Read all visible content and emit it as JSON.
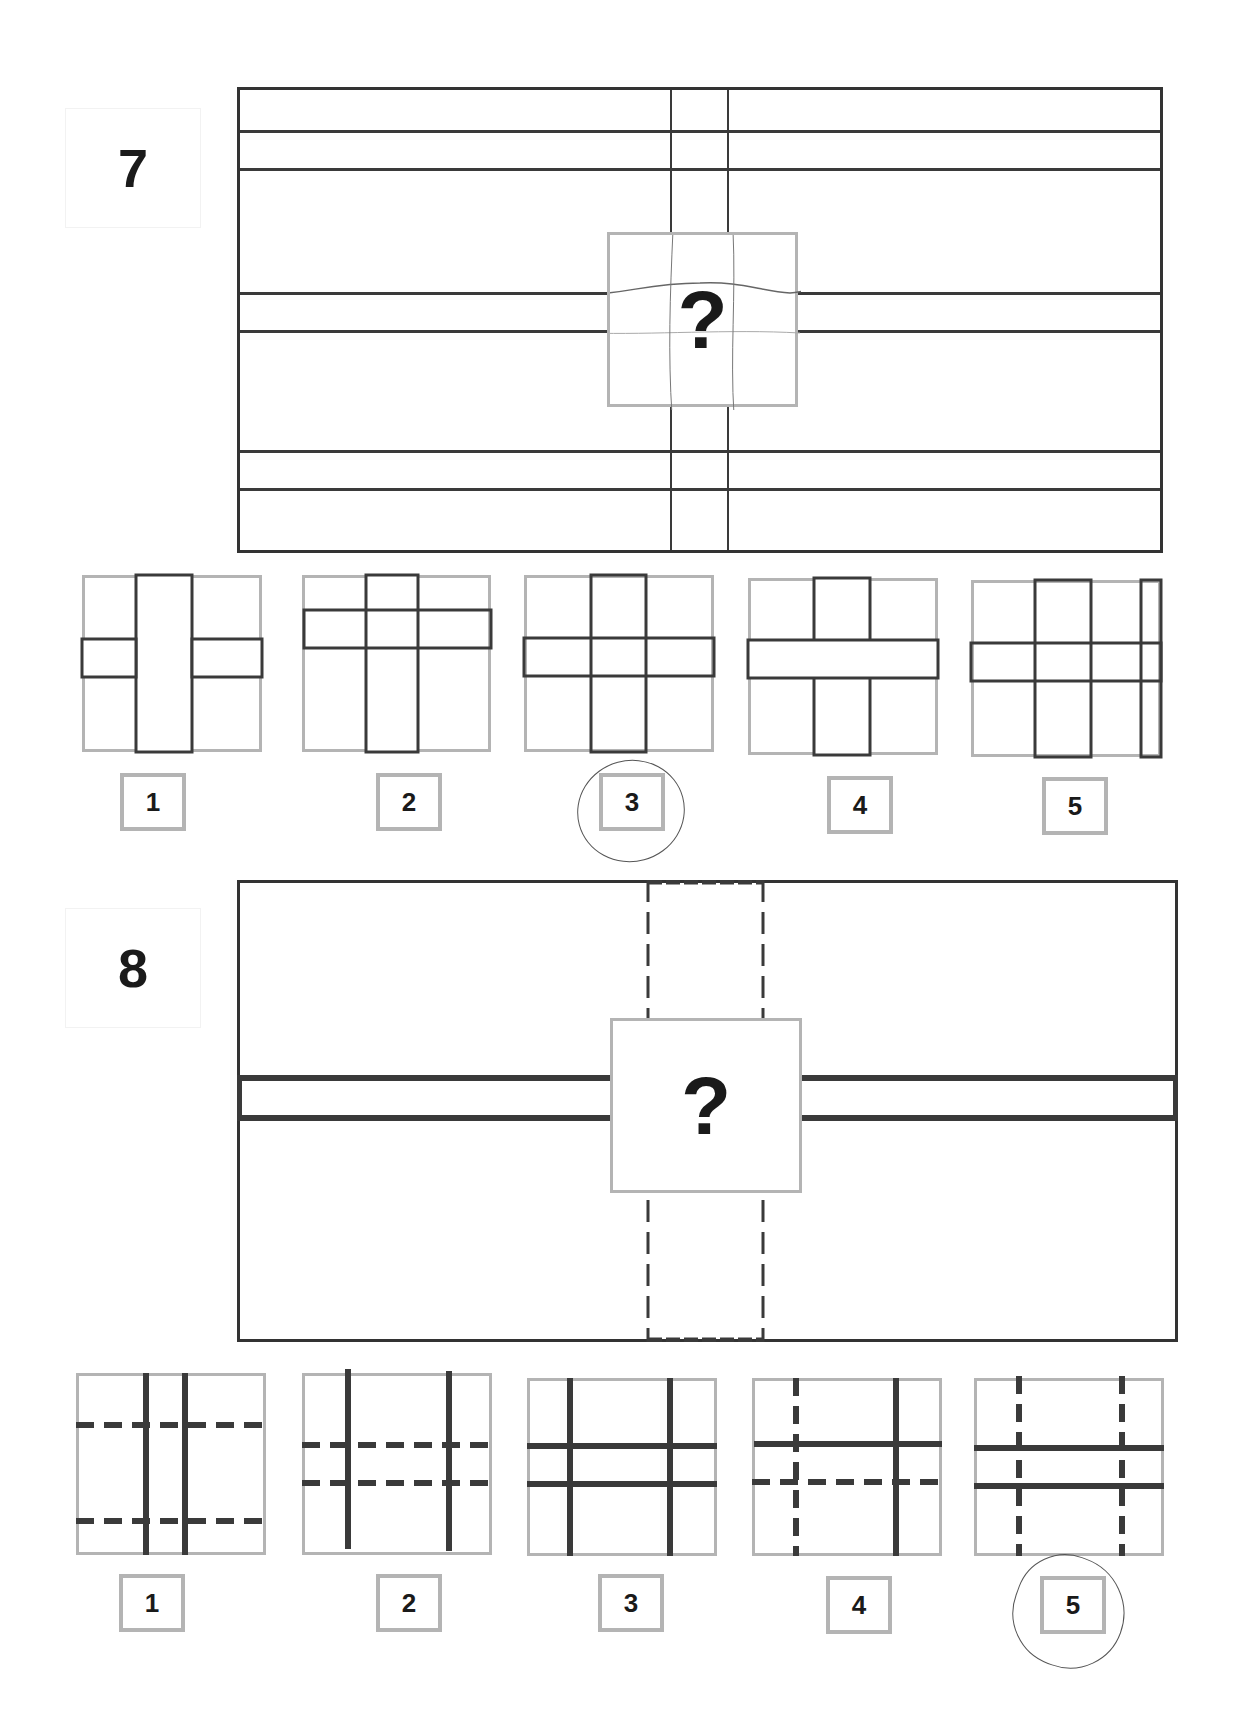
{
  "questions": [
    {
      "number": "7",
      "question_mark": "?",
      "selected_answer": "3",
      "options": [
        {
          "label": "1",
          "description": "narrow horizontal bar behind wide vertical bar"
        },
        {
          "label": "2",
          "description": "horizontal bar high, vertical bar full height"
        },
        {
          "label": "3",
          "description": "horizontal and vertical bars crossing, centered"
        },
        {
          "label": "4",
          "description": "horizontal bar in front of vertical bar"
        },
        {
          "label": "5",
          "description": "crossing bars plus extra narrow vertical bar on right"
        }
      ]
    },
    {
      "number": "8",
      "question_mark": "?",
      "selected_answer": "5",
      "options": [
        {
          "label": "1",
          "description": "two solid vertical lines, two dashed horizontal lines far apart"
        },
        {
          "label": "2",
          "description": "two solid vertical lines far apart, two dashed horizontal lines close"
        },
        {
          "label": "3",
          "description": "two solid vertical and two solid horizontal lines"
        },
        {
          "label": "4",
          "description": "one dashed and one solid vertical, one solid and one dashed horizontal"
        },
        {
          "label": "5",
          "description": "two dashed vertical lines, two solid horizontal lines"
        }
      ]
    }
  ],
  "colors": {
    "line": "#3a3a3a",
    "frame": "#b4b4b4",
    "text": "#1a1a1a"
  }
}
